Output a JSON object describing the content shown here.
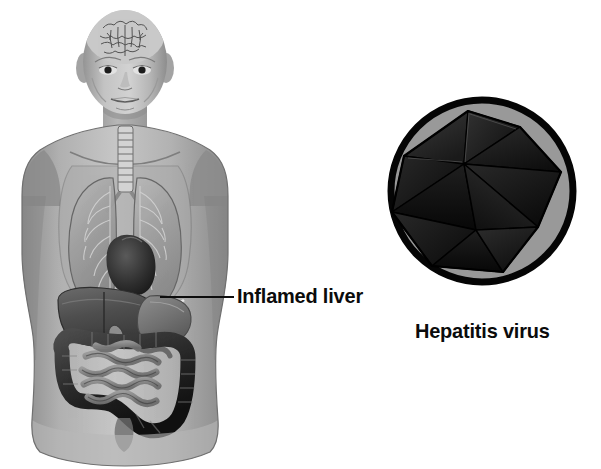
{
  "figure": {
    "background_color": "#ffffff"
  },
  "body_illustration": {
    "name": "human-torso-anatomy",
    "description": "Anterior view of bald male head, neck and torso with internal organs visible",
    "skin_color": "#b4b4b4",
    "organs": [
      {
        "name": "brain",
        "label": "Brain",
        "color": "#8e8e8e"
      },
      {
        "name": "trachea",
        "label": "Trachea",
        "color": "#cfcfcf"
      },
      {
        "name": "lungs",
        "label": "Lungs",
        "color": "#9a9a9a"
      },
      {
        "name": "heart",
        "label": "Heart",
        "color": "#3c3c3c"
      },
      {
        "name": "liver",
        "label": "Inflamed liver",
        "color": "#4a4a4a"
      },
      {
        "name": "stomach",
        "label": "Stomach",
        "color": "#787878"
      },
      {
        "name": "large-intestine",
        "label": "Large intestine",
        "color": "#2b2b2b"
      },
      {
        "name": "small-intestine",
        "label": "Small intestine",
        "color": "#676767"
      }
    ]
  },
  "callout": {
    "liver_label": "Inflamed liver",
    "leader_line_color": "#0d0d0d"
  },
  "virus_illustration": {
    "name": "hepatitis-virus-particle",
    "caption": "Hepatitis virus",
    "shape": "icosahedral capsid",
    "circle_fill": "#999999",
    "circle_stroke": "#000000",
    "capsid_color": "#151515",
    "circle_center": {
      "x": 482,
      "y": 191
    },
    "circle_radius": 95
  },
  "colors": {
    "text": "#0b0b0b",
    "outline": "#000000",
    "mid_gray": "#999999",
    "dark": "#151515"
  }
}
